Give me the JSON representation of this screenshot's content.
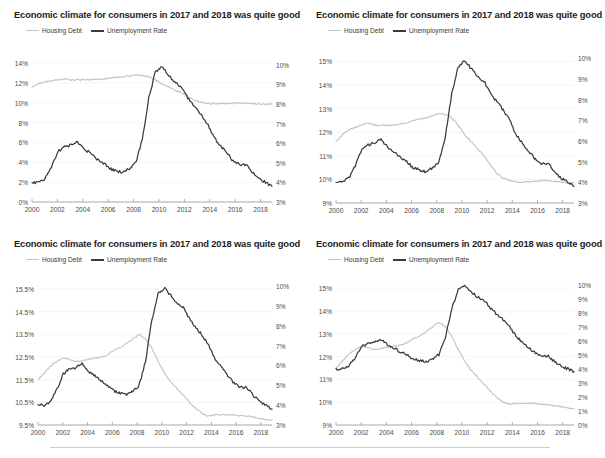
{
  "page": {
    "background": "#ffffff",
    "footer_rule": true
  },
  "colors": {
    "housing_debt": "#c4c4c4",
    "unemployment_rate": "#3b3b3b",
    "axis_text": "#4a4a4a",
    "title_text": "#1d1d1d",
    "gridline": "#f0f0f0",
    "axis_line": "#9a9a9a"
  },
  "common": {
    "title": "Economic climate for consumers in 2017 and 2018 was quite good",
    "legend": [
      {
        "label": "Housing Debt",
        "color": "#c4c4c4",
        "icon": "line-swatch-icon"
      },
      {
        "label": "Unemployment Rate",
        "color": "#3b3b3b",
        "icon": "line-swatch-icon"
      }
    ],
    "x_ticks": [
      "2000",
      "2002",
      "2004",
      "2006",
      "2008",
      "2010",
      "2012",
      "2014",
      "2016",
      "2018"
    ]
  },
  "chart_data": [
    {
      "id": "chart-top-left",
      "type": "line",
      "title": "Economic climate for consumers in 2017 and 2018 was quite good",
      "xlabel": "",
      "ylabel": "",
      "grid": true,
      "legend_position": "top-left",
      "x": [
        2000,
        2000.5,
        2001,
        2001.5,
        2002,
        2002.5,
        2003,
        2003.5,
        2004,
        2004.5,
        2005,
        2005.5,
        2006,
        2006.5,
        2007,
        2007.5,
        2008,
        2008.5,
        2009,
        2009.5,
        2010,
        2010.5,
        2011,
        2011.5,
        2012,
        2012.5,
        2013,
        2013.5,
        2014,
        2014.5,
        2015,
        2015.5,
        2016,
        2016.5,
        2017,
        2017.5,
        2018,
        2018.7
      ],
      "y_left_label": "Housing Debt",
      "y_left_ticks": [
        "0%",
        "2%",
        "4%",
        "6%",
        "8%",
        "10%",
        "12%",
        "14%"
      ],
      "y_left_lim": [
        0,
        15
      ],
      "y_right_label": "Unemployment Rate",
      "y_right_ticks": [
        "3%",
        "4%",
        "5%",
        "6%",
        "7%",
        "8%",
        "9%",
        "10%"
      ],
      "y_right_lim": [
        3,
        10.6
      ],
      "series": [
        {
          "name": "Housing Debt",
          "axis": "left",
          "color": "#c4c4c4",
          "values": [
            11.6,
            11.9,
            12.1,
            12.2,
            12.3,
            12.4,
            12.3,
            12.3,
            12.3,
            12.3,
            12.35,
            12.4,
            12.5,
            12.55,
            12.6,
            12.7,
            12.8,
            12.75,
            12.6,
            12.3,
            11.9,
            11.6,
            11.3,
            11.0,
            10.6,
            10.25,
            10.05,
            9.95,
            9.9,
            9.88,
            9.9,
            9.92,
            9.95,
            9.95,
            9.9,
            9.88,
            9.85,
            9.85
          ]
        },
        {
          "name": "Unemployment Rate",
          "axis": "right",
          "color": "#3b3b3b",
          "values": [
            4.0,
            4.0,
            4.2,
            4.8,
            5.6,
            5.8,
            5.9,
            6.1,
            5.7,
            5.5,
            5.2,
            5.0,
            4.7,
            4.6,
            4.5,
            4.7,
            5.0,
            6.2,
            8.3,
            9.6,
            9.9,
            9.5,
            9.1,
            8.9,
            8.3,
            7.9,
            7.5,
            7.0,
            6.3,
            5.9,
            5.5,
            5.1,
            4.9,
            4.9,
            4.5,
            4.2,
            4.0,
            3.8
          ]
        }
      ]
    },
    {
      "id": "chart-top-right",
      "type": "line",
      "title": "Economic climate for consumers in 2017 and 2018 was quite good",
      "grid": true,
      "legend_position": "top-left",
      "y_left_ticks": [
        "9%",
        "10%",
        "11%",
        "12%",
        "13%",
        "14%",
        "15%"
      ],
      "y_left_lim": [
        9,
        15.4
      ],
      "y_right_ticks": [
        "3%",
        "4%",
        "5%",
        "6%",
        "7%",
        "8%",
        "9%",
        "10%"
      ],
      "y_right_lim": [
        3,
        10.3
      ],
      "series": [
        {
          "name": "Housing Debt",
          "axis": "left",
          "color": "#c4c4c4",
          "values": [
            11.6,
            11.9,
            12.1,
            12.2,
            12.3,
            12.4,
            12.3,
            12.3,
            12.3,
            12.3,
            12.35,
            12.4,
            12.5,
            12.55,
            12.6,
            12.7,
            12.8,
            12.75,
            12.6,
            12.3,
            11.9,
            11.6,
            11.3,
            11.0,
            10.6,
            10.25,
            10.05,
            9.95,
            9.9,
            9.88,
            9.9,
            9.92,
            9.95,
            9.95,
            9.9,
            9.88,
            9.85,
            9.85
          ]
        },
        {
          "name": "Unemployment Rate",
          "axis": "right",
          "color": "#3b3b3b",
          "values": [
            4.0,
            4.0,
            4.2,
            4.8,
            5.6,
            5.8,
            5.9,
            6.1,
            5.7,
            5.5,
            5.2,
            5.0,
            4.7,
            4.6,
            4.5,
            4.7,
            5.0,
            6.2,
            8.3,
            9.6,
            9.9,
            9.5,
            9.1,
            8.9,
            8.3,
            7.9,
            7.5,
            7.0,
            6.3,
            5.9,
            5.5,
            5.1,
            4.9,
            4.9,
            4.5,
            4.2,
            4.0,
            3.8
          ]
        }
      ]
    },
    {
      "id": "chart-bottom-left",
      "type": "line",
      "title": "Economic climate for consumers in 2017 and 2018 was quite good",
      "grid": true,
      "legend_position": "top-left",
      "y_left_ticks": [
        "9.5%",
        "10.5%",
        "11.5%",
        "12.5%",
        "13.5%",
        "14.5%",
        "15.5%"
      ],
      "y_left_lim": [
        9.5,
        15.9
      ],
      "y_right_ticks": [
        "3%",
        "4%",
        "5%",
        "6%",
        "7%",
        "8%",
        "9%",
        "10%"
      ],
      "y_right_lim": [
        3,
        10.3
      ],
      "series": [
        {
          "name": "Housing Debt",
          "axis": "left",
          "color": "#c4c4c4",
          "values": [
            11.5,
            11.8,
            12.1,
            12.3,
            12.45,
            12.4,
            12.3,
            12.35,
            12.4,
            12.45,
            12.5,
            12.6,
            12.8,
            12.9,
            13.1,
            13.3,
            13.5,
            13.3,
            12.9,
            12.3,
            11.8,
            11.4,
            11.1,
            10.8,
            10.5,
            10.2,
            10.0,
            9.9,
            9.95,
            9.95,
            9.95,
            9.95,
            9.9,
            9.9,
            9.85,
            9.8,
            9.75,
            9.7
          ]
        },
        {
          "name": "Unemployment Rate",
          "axis": "right",
          "color": "#3b3b3b",
          "values": [
            4.0,
            4.0,
            4.2,
            4.8,
            5.6,
            5.8,
            5.9,
            6.1,
            5.7,
            5.5,
            5.2,
            5.0,
            4.7,
            4.6,
            4.5,
            4.7,
            5.0,
            6.2,
            8.3,
            9.6,
            9.9,
            9.5,
            9.1,
            8.9,
            8.3,
            7.9,
            7.5,
            7.0,
            6.3,
            5.9,
            5.5,
            5.1,
            4.9,
            4.9,
            4.5,
            4.2,
            4.0,
            3.8
          ]
        }
      ]
    },
    {
      "id": "chart-bottom-right",
      "type": "line",
      "title": "Economic climate for consumers in 2017 and 2018 was quite good",
      "grid": true,
      "legend_position": "top-left",
      "y_left_ticks": [
        "9%",
        "10%",
        "11%",
        "12%",
        "13%",
        "14%",
        "15%"
      ],
      "y_left_lim": [
        9,
        15.4
      ],
      "y_right_ticks": [
        "0%",
        "1%",
        "2%",
        "3%",
        "4%",
        "5%",
        "6%",
        "7%",
        "8%",
        "9%",
        "10%"
      ],
      "y_right_lim": [
        0,
        10.4
      ],
      "series": [
        {
          "name": "Housing Debt",
          "axis": "left",
          "color": "#c4c4c4",
          "values": [
            11.5,
            11.8,
            12.1,
            12.3,
            12.45,
            12.4,
            12.3,
            12.35,
            12.4,
            12.45,
            12.5,
            12.6,
            12.8,
            12.9,
            13.1,
            13.3,
            13.5,
            13.3,
            12.9,
            12.3,
            11.8,
            11.4,
            11.1,
            10.8,
            10.5,
            10.2,
            10.0,
            9.9,
            9.95,
            9.95,
            9.95,
            9.95,
            9.9,
            9.9,
            9.85,
            9.8,
            9.75,
            9.7
          ]
        },
        {
          "name": "Unemployment Rate",
          "axis": "right",
          "color": "#3b3b3b",
          "values": [
            4.0,
            4.0,
            4.2,
            4.8,
            5.6,
            5.8,
            5.9,
            6.1,
            5.7,
            5.5,
            5.2,
            5.0,
            4.7,
            4.6,
            4.5,
            4.7,
            5.0,
            6.2,
            8.3,
            9.6,
            9.9,
            9.5,
            9.1,
            8.9,
            8.3,
            7.9,
            7.5,
            7.0,
            6.3,
            5.9,
            5.5,
            5.1,
            4.9,
            4.9,
            4.5,
            4.2,
            4.0,
            3.8
          ]
        }
      ]
    }
  ]
}
